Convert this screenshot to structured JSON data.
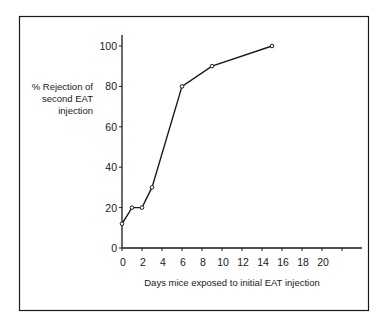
{
  "chart_data": {
    "type": "line",
    "title": "",
    "xlabel": "Days mice exposed to initial EAT injection",
    "ylabel": [
      "% Rejection of",
      "second EAT",
      "injection"
    ],
    "xlim": [
      0,
      24
    ],
    "ylim": [
      0,
      105
    ],
    "xticks": [
      0,
      2,
      4,
      6,
      8,
      10,
      12,
      14,
      16,
      18,
      20,
      22
    ],
    "xtick_labels": [
      "0",
      "2",
      "4",
      "6",
      "8",
      "10",
      "12",
      "14",
      "16",
      "18",
      "20",
      ""
    ],
    "yticks": [
      0,
      20,
      40,
      60,
      80,
      100
    ],
    "ytick_labels": [
      "0",
      "20",
      "40",
      "60",
      "80",
      "100"
    ],
    "grid": false,
    "legend": null,
    "series": [
      {
        "name": "% Rejection",
        "marker": "open-circle",
        "x": [
          0,
          1,
          2,
          3,
          6,
          9,
          15
        ],
        "values": [
          12,
          20,
          20,
          30,
          80,
          90,
          100
        ]
      }
    ]
  },
  "style": {
    "line_color": "#1a1a1a",
    "frame_color": "#1a1a1a",
    "background": "#ffffff"
  }
}
